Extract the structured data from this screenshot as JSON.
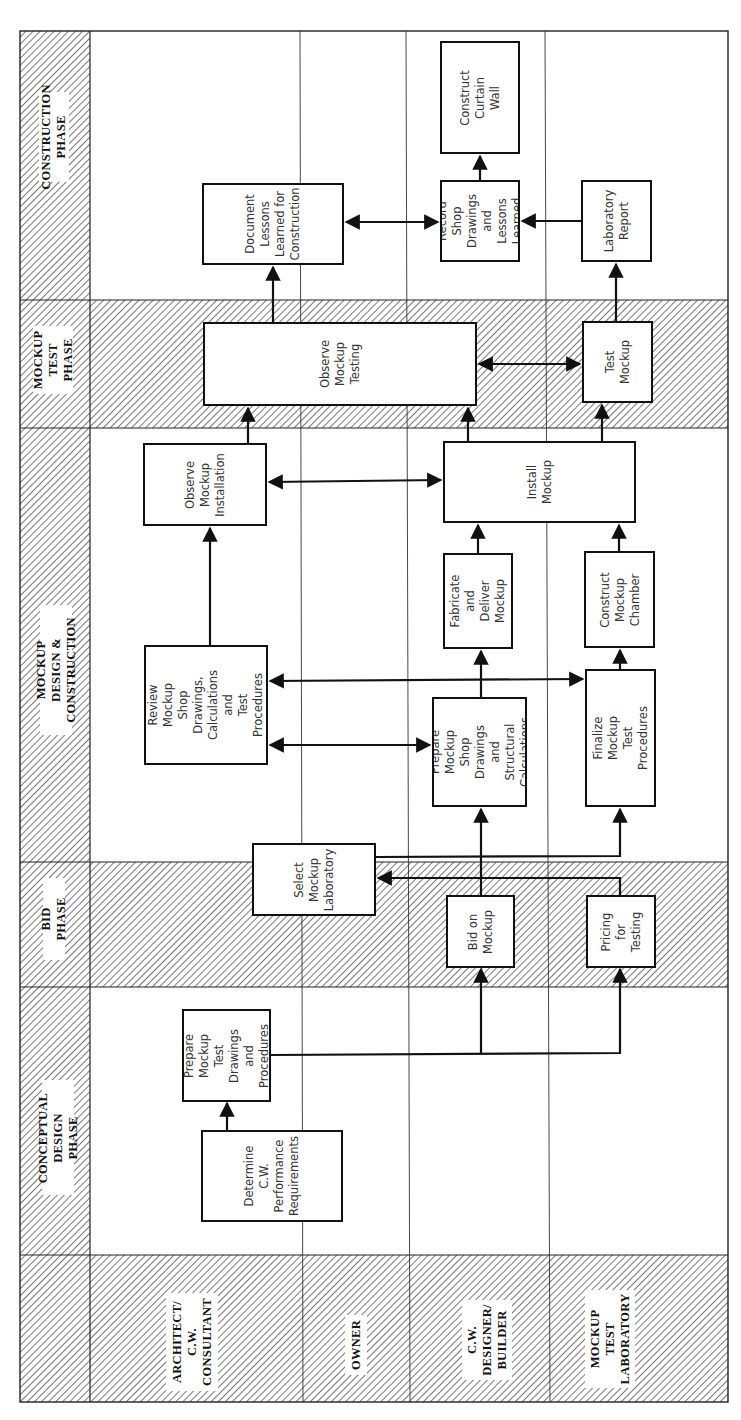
{
  "diagram": {
    "orientation": "rotated-90-ccw",
    "hatch_color": "#555555",
    "line_color": "#111111",
    "phases": [
      {
        "id": "construction",
        "label": "CONSTRUCTION\nPHASE",
        "shaded": false
      },
      {
        "id": "mockup_test",
        "label": "MOCKUP\nTEST\nPHASE",
        "shaded": true
      },
      {
        "id": "mockup_design",
        "label": "MOCKUP DESIGN &\nCONSTRUCTION",
        "shaded": false
      },
      {
        "id": "bid",
        "label": "BID PHASE",
        "shaded": true
      },
      {
        "id": "conceptual",
        "label": "CONCEPTUAL\nDESIGN PHASE",
        "shaded": false
      }
    ],
    "lanes": [
      {
        "id": "architect",
        "label": "ARCHITECT/\nC.W.\nCONSULTANT"
      },
      {
        "id": "owner",
        "label": "OWNER"
      },
      {
        "id": "designer",
        "label": "C.W.\nDESIGNER/\nBUILDER"
      },
      {
        "id": "lab",
        "label": "MOCKUP\nTEST\nLABORATORY"
      }
    ],
    "tasks": [
      {
        "id": "determine",
        "text": "Determine\nC.W.\nPerformance\nRequirements",
        "lane": "architect",
        "phase": "conceptual"
      },
      {
        "id": "prepare_test_drawings",
        "text": "Prepare\nMockup Test\nDrawings and\nProcedures",
        "lane": "architect",
        "phase": "conceptual"
      },
      {
        "id": "select_lab",
        "text": "Select\nMockup\nLaboratory",
        "lane": "owner",
        "phase": "bid"
      },
      {
        "id": "bid_mockup",
        "text": "Bid on\nMockup",
        "lane": "designer",
        "phase": "bid"
      },
      {
        "id": "pricing",
        "text": "Pricing for\nTesting",
        "lane": "lab",
        "phase": "bid"
      },
      {
        "id": "review",
        "text": "Review Mockup\nShop Drawings,\nCalculations and\nTest Procedures",
        "lane": "architect",
        "phase": "mockup_design"
      },
      {
        "id": "prepare_shop",
        "text": "Prepare Mockup\nShop Drawings\nand Structural\nCalculations",
        "lane": "designer",
        "phase": "mockup_design"
      },
      {
        "id": "finalize",
        "text": "Finalize Mockup Test\nProcedures",
        "lane": "lab",
        "phase": "mockup_design"
      },
      {
        "id": "fabricate",
        "text": "Fabricate and\nDeliver\nMockup",
        "lane": "designer",
        "phase": "mockup_design"
      },
      {
        "id": "construct_chamber",
        "text": "Construct\nMockup\nChamber",
        "lane": "lab",
        "phase": "mockup_design"
      },
      {
        "id": "observe_install",
        "text": "Observe\nMockup\nInstallation",
        "lane": "architect",
        "phase": "mockup_design"
      },
      {
        "id": "install",
        "text": "Install\nMockup",
        "lane": "designer",
        "phase": "mockup_design"
      },
      {
        "id": "observe_testing",
        "text": "Observe\nMockup\nTesting",
        "lane": "architect",
        "phase": "mockup_test"
      },
      {
        "id": "test_mockup",
        "text": "Test Mockup",
        "lane": "lab",
        "phase": "mockup_test"
      },
      {
        "id": "document",
        "text": "Document\nLessons\nLearned for\nConstruction",
        "lane": "architect",
        "phase": "construction"
      },
      {
        "id": "record",
        "text": "Record Shop\nDrawings\nand Lessons\nLearned",
        "lane": "designer",
        "phase": "construction"
      },
      {
        "id": "lab_report",
        "text": "Laboratory\nReport",
        "lane": "lab",
        "phase": "construction"
      },
      {
        "id": "construct_cw",
        "text": "Construct Curtain\nWall",
        "lane": "designer",
        "phase": "construction"
      }
    ],
    "flows": [
      {
        "from": "determine",
        "to": "prepare_test_drawings",
        "type": "arrow"
      },
      {
        "from": "prepare_test_drawings",
        "to": "bid_mockup",
        "type": "arrow"
      },
      {
        "from": "prepare_test_drawings",
        "to": "pricing",
        "type": "arrow"
      },
      {
        "from": "bid_mockup",
        "to": "select_lab",
        "type": "arrow"
      },
      {
        "from": "pricing",
        "to": "select_lab",
        "type": "arrow"
      },
      {
        "from": "bid_mockup",
        "to": "prepare_shop",
        "type": "arrow"
      },
      {
        "from": "select_lab",
        "to": "finalize",
        "type": "arrow"
      },
      {
        "from": "review",
        "to": "prepare_shop",
        "type": "bidirectional"
      },
      {
        "from": "review",
        "to": "finalize",
        "type": "bidirectional"
      },
      {
        "from": "review",
        "to": "observe_install",
        "type": "arrow"
      },
      {
        "from": "prepare_shop",
        "to": "fabricate",
        "type": "arrow"
      },
      {
        "from": "finalize",
        "to": "construct_chamber",
        "type": "arrow"
      },
      {
        "from": "fabricate",
        "to": "install",
        "type": "arrow"
      },
      {
        "from": "construct_chamber",
        "to": "install",
        "type": "arrow"
      },
      {
        "from": "observe_install",
        "to": "install",
        "type": "bidirectional"
      },
      {
        "from": "observe_install",
        "to": "observe_testing",
        "type": "arrow"
      },
      {
        "from": "install",
        "to": "observe_testing",
        "type": "arrow"
      },
      {
        "from": "install",
        "to": "test_mockup",
        "type": "arrow"
      },
      {
        "from": "observe_testing",
        "to": "test_mockup",
        "type": "bidirectional"
      },
      {
        "from": "observe_testing",
        "to": "document",
        "type": "arrow"
      },
      {
        "from": "test_mockup",
        "to": "lab_report",
        "type": "arrow"
      },
      {
        "from": "document",
        "to": "record",
        "type": "bidirectional"
      },
      {
        "from": "lab_report",
        "to": "record",
        "type": "arrow"
      },
      {
        "from": "record",
        "to": "construct_cw",
        "type": "arrow"
      }
    ]
  }
}
